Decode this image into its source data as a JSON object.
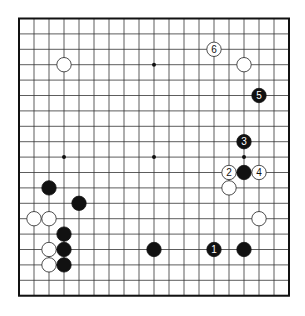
{
  "diagram": {
    "type": "go-board",
    "size": 19,
    "colors": {
      "background": "#ffffff",
      "grid": "#333333",
      "border": "#111111",
      "black_stone": "#111111",
      "white_stone": "#ffffff",
      "white_stroke": "#222222"
    },
    "geometry": {
      "x0": 19,
      "y0": 18.5,
      "dx": 15,
      "dy": 15.4,
      "stone_r": 7.2
    },
    "hoshi": [
      [
        3,
        3
      ],
      [
        9,
        3
      ],
      [
        15,
        3
      ],
      [
        3,
        9
      ],
      [
        9,
        9
      ],
      [
        15,
        9
      ],
      [
        3,
        15
      ],
      [
        9,
        15
      ],
      [
        15,
        15
      ]
    ],
    "stones": [
      {
        "color": "white",
        "col": 3,
        "row": 3,
        "label": ""
      },
      {
        "color": "white",
        "col": 13,
        "row": 2,
        "label": "6"
      },
      {
        "color": "white",
        "col": 15,
        "row": 3,
        "label": ""
      },
      {
        "color": "black",
        "col": 16,
        "row": 5,
        "label": "5"
      },
      {
        "color": "black",
        "col": 15,
        "row": 8,
        "label": "3"
      },
      {
        "color": "white",
        "col": 14,
        "row": 10,
        "label": "2"
      },
      {
        "color": "black",
        "col": 15,
        "row": 10,
        "label": ""
      },
      {
        "color": "white",
        "col": 16,
        "row": 10,
        "label": "4"
      },
      {
        "color": "white",
        "col": 14,
        "row": 11,
        "label": ""
      },
      {
        "color": "black",
        "col": 2,
        "row": 11,
        "label": ""
      },
      {
        "color": "black",
        "col": 4,
        "row": 12,
        "label": ""
      },
      {
        "color": "white",
        "col": 1,
        "row": 13,
        "label": ""
      },
      {
        "color": "white",
        "col": 2,
        "row": 13,
        "label": ""
      },
      {
        "color": "white",
        "col": 16,
        "row": 13,
        "label": ""
      },
      {
        "color": "black",
        "col": 3,
        "row": 14,
        "label": ""
      },
      {
        "color": "white",
        "col": 2,
        "row": 15,
        "label": ""
      },
      {
        "color": "black",
        "col": 3,
        "row": 15,
        "label": ""
      },
      {
        "color": "black",
        "col": 9,
        "row": 15,
        "label": ""
      },
      {
        "color": "black",
        "col": 13,
        "row": 15,
        "label": "1"
      },
      {
        "color": "black",
        "col": 15,
        "row": 15,
        "label": ""
      },
      {
        "color": "white",
        "col": 2,
        "row": 16,
        "label": ""
      },
      {
        "color": "black",
        "col": 3,
        "row": 16,
        "label": ""
      }
    ]
  }
}
